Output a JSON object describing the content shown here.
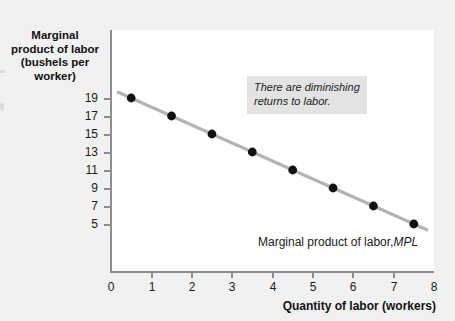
{
  "chart_data": {
    "type": "scatter",
    "title": "",
    "xlabel": "Quantity of labor (workers)",
    "ylabel": "Marginal product of labor (bushels per worker)",
    "ylabel_lines": [
      "Marginal",
      "product of labor",
      "(bushels per",
      "worker)"
    ],
    "x": [
      0.5,
      1.5,
      2.5,
      3.5,
      4.5,
      5.5,
      6.5,
      7.5
    ],
    "values": [
      19,
      17,
      15,
      13,
      11,
      9,
      7,
      5
    ],
    "series": [
      {
        "name": "Marginal product of labor, MPL",
        "x": [
          0.5,
          1.5,
          2.5,
          3.5,
          4.5,
          5.5,
          6.5,
          7.5
        ],
        "values": [
          19,
          17,
          15,
          13,
          11,
          9,
          7,
          5
        ]
      }
    ],
    "xlim": [
      0,
      8
    ],
    "ylim": [
      0,
      20
    ],
    "xticks": [
      0,
      1,
      2,
      3,
      4,
      5,
      6,
      7,
      8
    ],
    "xtick_labels": [
      "0",
      "1",
      "2",
      "3",
      "4",
      "5",
      "6",
      "7",
      "8"
    ],
    "yticks": [
      19,
      17,
      15,
      13,
      11,
      9,
      7,
      5
    ],
    "ytick_labels": [
      "19",
      "17",
      "15",
      "13",
      "11",
      "9",
      "7",
      "5"
    ],
    "grid": false,
    "legend": "none",
    "line_color": "#b4b4b4",
    "marker_color": "#111111",
    "axis_color": "#8d8d8d",
    "plot_background": "#ffffff",
    "page_background": "#f1f1f1",
    "annotations": [
      {
        "name": "diminishing-returns-note",
        "text": "There are diminishing returns to labor.",
        "lines": [
          "There are diminishing",
          "returns to labor."
        ],
        "style": "italic",
        "background": "#e3e3e3"
      },
      {
        "name": "curve-label",
        "text_prefix": "Marginal product of labor, ",
        "text_symbol": "MPL",
        "style": "italic-symbol"
      }
    ]
  },
  "axes": {
    "y_title_lines": [
      "Marginal",
      "product of labor",
      "(bushels per",
      "worker)"
    ],
    "x_title": "Quantity of labor (workers)",
    "y_ticks": [
      "19",
      "17",
      "15",
      "13",
      "11",
      "9",
      "7",
      "5"
    ],
    "x_ticks": [
      "0",
      "1",
      "2",
      "3",
      "4",
      "5",
      "6",
      "7",
      "8"
    ]
  },
  "annotation": {
    "line1": "There are diminishing",
    "line2": "returns to labor."
  },
  "curve_label": {
    "prefix": "Marginal product of labor,",
    "symbol": "MPL"
  }
}
